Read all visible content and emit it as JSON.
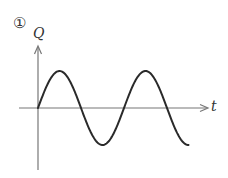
{
  "figure": {
    "number_label": "①",
    "y_axis_label": "Q",
    "x_axis_label": "t",
    "colors": {
      "axis": "#777777",
      "curve": "#2a2a2a"
    }
  },
  "chart_data": {
    "type": "line",
    "title": "",
    "xlabel": "t",
    "ylabel": "Q",
    "series": [
      {
        "name": "Q(t)",
        "x": [
          0,
          0.25,
          0.5,
          0.75,
          1.0,
          1.25,
          1.5,
          1.75
        ],
        "values": [
          0,
          1,
          0,
          -1,
          0,
          1,
          0,
          -1
        ]
      }
    ],
    "grid": false,
    "legend": "none"
  }
}
